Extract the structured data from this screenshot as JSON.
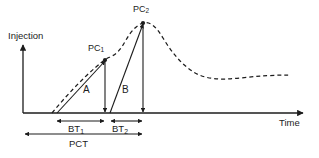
{
  "figure": {
    "background_color": "#ffffff",
    "stroke_color": "#1c1c1c"
  },
  "axes": {
    "y_label": "Injection",
    "x_label": "Time",
    "origin": {
      "x": 23,
      "y": 113
    },
    "y_top": {
      "x": 23,
      "y": 44
    },
    "x_right": {
      "x": 305,
      "y": 113
    }
  },
  "curve": {
    "name": "response-curve",
    "style": "dashed",
    "dash_pattern": "4 3",
    "description": "Dashed response curve rising from baseline, shoulder at PC1, peak at PC2, then long decay tail"
  },
  "points": [
    {
      "id": "PC1",
      "label": "PC",
      "subscript": "1",
      "x": 105,
      "y": 60
    },
    {
      "id": "PC2",
      "label": "PC",
      "subscript": "2",
      "x": 143,
      "y": 23
    }
  ],
  "segments": [
    {
      "id": "A",
      "label": "A",
      "from_x": 57,
      "from_y": 113,
      "to_x": 105,
      "to_y": 60,
      "label_x": 83,
      "label_y": 86
    },
    {
      "id": "B",
      "label": "B",
      "from_x": 110,
      "from_y": 113,
      "to_x": 143,
      "to_y": 23,
      "label_x": 122,
      "label_y": 86
    }
  ],
  "drop_lines": [
    {
      "id": "pc1-drop",
      "x": 105,
      "from_y": 60,
      "to_y": 113
    },
    {
      "id": "pc2-drop",
      "x": 143,
      "from_y": 23,
      "to_y": 113
    }
  ],
  "intervals": [
    {
      "id": "BT1",
      "label": "BT",
      "subscript": "1",
      "start_x": 56,
      "end_x": 105,
      "y": 121,
      "label_x": 73,
      "label_y": 124
    },
    {
      "id": "BT2",
      "label": "BT",
      "subscript": "2",
      "start_x": 110,
      "end_x": 143,
      "y": 121,
      "label_x": 113,
      "label_y": 124
    },
    {
      "id": "PCT",
      "label": "PCT",
      "subscript": "",
      "start_x": 24,
      "end_x": 143,
      "y": 134,
      "label_x": 72,
      "label_y": 139
    }
  ]
}
